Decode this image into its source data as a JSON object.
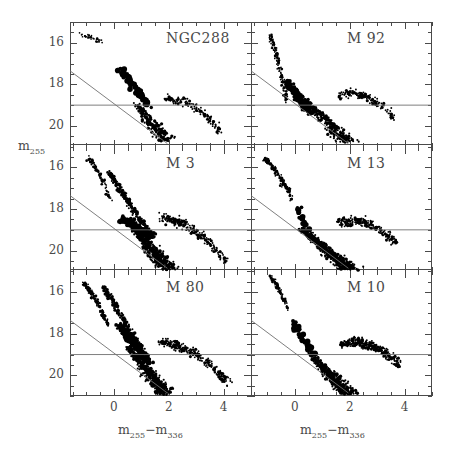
{
  "figure": {
    "background": "#ffffff",
    "frame_color": "#4a4a4a",
    "point_color": "#000000",
    "refline_color": "#707070"
  },
  "axes": {
    "x_label_html": "m<sub>255</sub>−m<sub>336</sub>",
    "x_label_text": "m255-m336",
    "y_label_html": "m<sub>255</sub>",
    "y_label_text": "m255",
    "x_ticks": [
      0,
      2,
      4
    ],
    "x_tick_labels": [
      "0",
      "2",
      "4"
    ],
    "y_ticks": [
      16,
      18,
      20
    ],
    "y_tick_labels": [
      "16",
      "18",
      "20"
    ],
    "xlim": [
      -1.6,
      5.0
    ],
    "ylim_top_to_bottom": [
      15.0,
      21.0
    ],
    "x_minor_step": 0.5,
    "y_minor_step": 0.5
  },
  "chart_data": {
    "type": "scatter",
    "title": "",
    "xlabel": "m255 - m336",
    "ylabel": "m255",
    "xlim": [
      -1.6,
      5.0
    ],
    "ylim": [
      21.0,
      15.0
    ],
    "y_inverted": true,
    "grid": false,
    "legend": "none",
    "shared_axes": true,
    "reference_lines": [
      {
        "name": "horizontal-limit",
        "type": "horizontal",
        "y": 19.0
      },
      {
        "name": "diagonal-limit",
        "type": "line",
        "x1": -1.6,
        "y1": 17.35,
        "x2": 1.95,
        "y2": 20.85
      }
    ],
    "panels": [
      {
        "id": "ngc288",
        "label": "NGC288",
        "row": 0,
        "col": 0,
        "n_points": 430,
        "features": {
          "horizontal_branch": {
            "x_range": [
              -1.25,
              -0.35
            ],
            "y_range": [
              15.6,
              16.0
            ],
            "n": 34
          },
          "blue_straggler_clump": {
            "x_range": [
              0.25,
              1.25
            ],
            "y_range": [
              17.3,
              19.0
            ],
            "n": 70,
            "big_markers": true
          },
          "main_sequence": {
            "x_range": [
              0.8,
              1.9
            ],
            "y_range": [
              18.9,
              20.7
            ],
            "n": 190
          },
          "red_giants": {
            "x_range": [
              1.9,
              3.9
            ],
            "y_range": [
              18.7,
              20.3
            ],
            "n": 120
          }
        }
      },
      {
        "id": "m92",
        "label": "M 92",
        "row": 0,
        "col": 1,
        "n_points": 760,
        "features": {
          "blue_horizontal_branch": {
            "x_range": [
              -0.9,
              -0.3
            ],
            "y_range": [
              15.7,
              18.8
            ],
            "n": 150
          },
          "turnoff_clump": {
            "x_range": [
              -0.3,
              0.6
            ],
            "y_range": [
              17.9,
              19.4
            ],
            "n": 210
          },
          "main_sequence": {
            "x_range": [
              0.3,
              1.9
            ],
            "y_range": [
              18.6,
              20.8
            ],
            "n": 260
          },
          "red_giants": {
            "x_range": [
              1.6,
              3.6
            ],
            "y_range": [
              18.5,
              19.6
            ],
            "n": 140
          }
        }
      },
      {
        "id": "m3",
        "label": "M 3",
        "row": 1,
        "col": 0,
        "n_points": 1120,
        "features": {
          "blue_horizontal_branch": {
            "x_range": [
              -0.9,
              -0.1
            ],
            "y_range": [
              15.6,
              17.6
            ],
            "n": 90
          },
          "subgiant_sequence": {
            "x_range": [
              -0.2,
              1.2
            ],
            "y_range": [
              16.2,
              19.0
            ],
            "n": 220
          },
          "turnoff_clump": {
            "x_range": [
              0.3,
              1.4
            ],
            "y_range": [
              18.5,
              19.3
            ],
            "n": 170
          },
          "main_sequence": {
            "x_range": [
              0.6,
              2.0
            ],
            "y_range": [
              18.7,
              20.9
            ],
            "n": 420
          },
          "red_giants": {
            "x_range": [
              1.7,
              4.1
            ],
            "y_range": [
              18.4,
              20.5
            ],
            "n": 220
          }
        }
      },
      {
        "id": "m13",
        "label": "M 13",
        "row": 1,
        "col": 1,
        "n_points": 980,
        "features": {
          "blue_horizontal_branch": {
            "x_range": [
              -1.1,
              -0.1
            ],
            "y_range": [
              15.6,
              17.5
            ],
            "n": 170
          },
          "bright_clump": {
            "x_range": [
              0.1,
              0.5
            ],
            "y_range": [
              18.0,
              19.0
            ],
            "n": 18,
            "big_markers": true
          },
          "main_sequence": {
            "x_range": [
              0.2,
              2.0
            ],
            "y_range": [
              18.9,
              20.9
            ],
            "n": 520
          },
          "red_giants": {
            "x_range": [
              1.6,
              3.7
            ],
            "y_range": [
              18.7,
              19.6
            ],
            "n": 200
          }
        }
      },
      {
        "id": "m80",
        "label": "M 80",
        "row": 2,
        "col": 0,
        "n_points": 1260,
        "features": {
          "blue_horizontal_branch": {
            "x_range": [
              -1.1,
              -0.2
            ],
            "y_range": [
              15.6,
              17.6
            ],
            "n": 190
          },
          "subgiant_sequence": {
            "x_range": [
              -0.4,
              1.1
            ],
            "y_range": [
              15.7,
              18.9
            ],
            "n": 190
          },
          "turnoff_clump": {
            "x_range": [
              0.2,
              1.3
            ],
            "y_range": [
              17.6,
              19.4
            ],
            "n": 230
          },
          "main_sequence": {
            "x_range": [
              0.5,
              1.9
            ],
            "y_range": [
              18.6,
              20.9
            ],
            "n": 400
          },
          "red_giants": {
            "x_range": [
              1.7,
              4.2
            ],
            "y_range": [
              18.4,
              20.4
            ],
            "n": 250
          }
        }
      },
      {
        "id": "m10",
        "label": "M 10",
        "row": 2,
        "col": 1,
        "n_points": 900,
        "features": {
          "blue_horizontal_branch": {
            "x_range": [
              -0.9,
              -0.25
            ],
            "y_range": [
              15.3,
              16.8
            ],
            "n": 90
          },
          "bright_clump": {
            "x_range": [
              -0.1,
              0.7
            ],
            "y_range": [
              17.5,
              19.0
            ],
            "n": 30,
            "big_markers": true
          },
          "main_sequence": {
            "x_range": [
              0.5,
              2.0
            ],
            "y_range": [
              18.9,
              20.9
            ],
            "n": 430
          },
          "red_giants": {
            "x_range": [
              1.7,
              3.8
            ],
            "y_range": [
              18.5,
              19.5
            ],
            "n": 280
          }
        }
      }
    ]
  }
}
